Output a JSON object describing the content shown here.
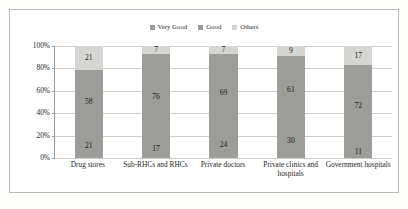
{
  "chart_data": {
    "type": "bar",
    "subtype": "100% stacked bar",
    "title": "",
    "subtitle": "",
    "xlabel": "",
    "ylabel": "",
    "ylim": [
      0,
      100
    ],
    "ytick_labels": [
      "100%",
      "80%",
      "60%",
      "40%",
      "20%",
      "0%"
    ],
    "ytick_values": [
      100,
      80,
      60,
      40,
      20,
      0
    ],
    "grid": true,
    "legend_position": "top-center",
    "categories": [
      "Drug stores",
      "Sub-RHCs and RHCs",
      "Private doctors",
      "Private clinics and hospitals",
      "Government hospitals"
    ],
    "series": [
      {
        "name": "Very Good",
        "color": "#9c9c99",
        "values": [
          21,
          17,
          24,
          30,
          11
        ]
      },
      {
        "name": "Good",
        "color": "#9c9c99",
        "values": [
          58,
          76,
          69,
          61,
          72
        ]
      },
      {
        "name": "Others",
        "color": "#d5d5d2",
        "values": [
          21,
          7,
          7,
          9,
          17
        ]
      }
    ]
  },
  "colors": {
    "very_good": "#9c9c99",
    "good": "#9c9c99",
    "others": "#d5d5d2",
    "gridline": "#ccccc9",
    "axis": "#9a9a97",
    "frame": "#b9b9b6",
    "background": "#ffffff"
  }
}
